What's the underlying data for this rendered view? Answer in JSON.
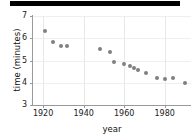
{
  "chart_data": {
    "type": "scatter",
    "title": "",
    "xlabel": "year",
    "ylabel": "time (minutes)",
    "xlim": [
      1915,
      1993
    ],
    "ylim": [
      3,
      7
    ],
    "grid": true,
    "legend": false,
    "marker_color": "#808080",
    "xticks": [
      1920,
      1940,
      1960,
      1980
    ],
    "yticks": [
      3,
      4,
      5,
      6,
      7
    ],
    "x": [
      1921,
      1925,
      1929,
      1932,
      1948,
      1953,
      1955,
      1960,
      1963,
      1965,
      1967,
      1971,
      1976,
      1980,
      1984,
      1990
    ],
    "y": [
      6.32,
      5.83,
      5.65,
      5.64,
      5.52,
      5.37,
      4.95,
      4.83,
      4.74,
      4.68,
      4.59,
      4.44,
      4.21,
      4.15,
      4.2,
      4.0
    ],
    "points": [
      {
        "year": 1921,
        "time": 6.32
      },
      {
        "year": 1925,
        "time": 5.83
      },
      {
        "year": 1929,
        "time": 5.65
      },
      {
        "year": 1932,
        "time": 5.64
      },
      {
        "year": 1948,
        "time": 5.52
      },
      {
        "year": 1953,
        "time": 5.37
      },
      {
        "year": 1955,
        "time": 4.95
      },
      {
        "year": 1960,
        "time": 4.83
      },
      {
        "year": 1963,
        "time": 4.74
      },
      {
        "year": 1965,
        "time": 4.68
      },
      {
        "year": 1967,
        "time": 4.59
      },
      {
        "year": 1971,
        "time": 4.44
      },
      {
        "year": 1976,
        "time": 4.21
      },
      {
        "year": 1980,
        "time": 4.15
      },
      {
        "year": 1984,
        "time": 4.2
      },
      {
        "year": 1990,
        "time": 4.0
      }
    ]
  },
  "axis": {
    "ytick_labels": [
      "7",
      "6",
      "5",
      "4",
      "3"
    ],
    "xtick_labels": [
      "1920",
      "1940",
      "1960",
      "1980"
    ],
    "ylabel": "time (minutes)",
    "xlabel": "year"
  },
  "topbar": {
    "color": "#000000"
  }
}
